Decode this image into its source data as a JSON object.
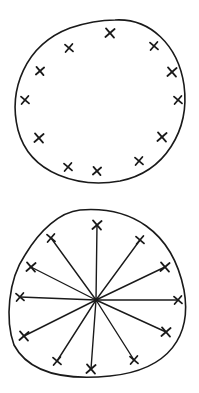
{
  "diagram": {
    "type": "hand-drawn sketch",
    "stroke_color": "#1a1a1a",
    "background": "#ffffff",
    "panels": [
      {
        "id": "top",
        "description": "Closed loop with 12 X marks spaced around the inside of its boundary",
        "outline_path": "M115,20 C150,18 178,45 184,85 C190,130 165,172 120,181 C80,188 30,175 18,130 C8,90 25,45 70,28 C88,22 100,20 115,20 Z",
        "marks": [
          {
            "x": 110,
            "y": 33,
            "r": 4
          },
          {
            "x": 154,
            "y": 46,
            "r": 4
          },
          {
            "x": 172,
            "y": 72,
            "r": 4
          },
          {
            "x": 178,
            "y": 100,
            "r": 4
          },
          {
            "x": 162,
            "y": 137,
            "r": 4
          },
          {
            "x": 139,
            "y": 161,
            "r": 4
          },
          {
            "x": 97,
            "y": 171,
            "r": 3.5
          },
          {
            "x": 68,
            "y": 167,
            "r": 4
          },
          {
            "x": 39,
            "y": 138,
            "r": 4
          },
          {
            "x": 25,
            "y": 100,
            "r": 4
          },
          {
            "x": 40,
            "y": 71,
            "r": 3.5
          },
          {
            "x": 69,
            "y": 48,
            "r": 4
          }
        ]
      },
      {
        "id": "bottom",
        "description": "Closed loop with 12 X marks, each connected to a common central point by a straight line (spokes)",
        "outline_path": "M80,210 C130,206 172,230 184,290 C192,335 170,370 110,376 C70,380 30,375 14,345 C5,320 8,280 25,255 C40,230 60,212 80,210 Z",
        "center": {
          "x": 96,
          "y": 300
        },
        "marks": [
          {
            "x": 97,
            "y": 225,
            "r": 4
          },
          {
            "x": 140,
            "y": 240,
            "r": 4
          },
          {
            "x": 165,
            "y": 267,
            "r": 4
          },
          {
            "x": 178,
            "y": 300,
            "r": 4
          },
          {
            "x": 166,
            "y": 332,
            "r": 4
          },
          {
            "x": 134,
            "y": 360,
            "r": 4
          },
          {
            "x": 91,
            "y": 369,
            "r": 4
          },
          {
            "x": 57,
            "y": 361,
            "r": 4
          },
          {
            "x": 24,
            "y": 336,
            "r": 4
          },
          {
            "x": 20,
            "y": 297,
            "r": 4
          },
          {
            "x": 31,
            "y": 267,
            "r": 4
          },
          {
            "x": 51,
            "y": 238,
            "r": 4
          }
        ]
      }
    ]
  }
}
